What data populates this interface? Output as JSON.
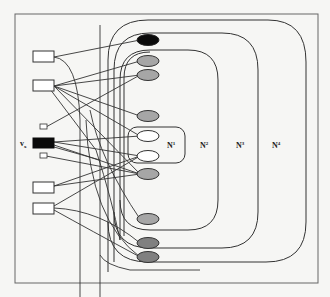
{
  "figure": {
    "labels": {
      "v": "v",
      "v_sub": "x",
      "n1": "N",
      "n1_sup": "1",
      "n2": "N",
      "n2_sup": "2",
      "n3": "N",
      "n3_sup": "3",
      "n4": "N",
      "n4_sup": "4"
    },
    "colors": {
      "background": "#f6f6f4",
      "stroke": "#333333",
      "black_node": "#0a0a0a",
      "gray_node": "#a6a6a6",
      "dark_gray_node": "#808080",
      "white_node": "#ffffff"
    },
    "left_nodes": [
      {
        "id": "box-1",
        "type": "rect"
      },
      {
        "id": "box-2",
        "type": "rect"
      },
      {
        "id": "small-box-1",
        "type": "small-rect"
      },
      {
        "id": "vx-box",
        "type": "black-rect"
      },
      {
        "id": "small-box-2",
        "type": "small-rect"
      },
      {
        "id": "box-3",
        "type": "rect"
      },
      {
        "id": "box-4",
        "type": "rect"
      }
    ],
    "right_nodes": [
      {
        "id": "ellipse-1",
        "fill": "black"
      },
      {
        "id": "ellipse-2",
        "fill": "gray"
      },
      {
        "id": "ellipse-3",
        "fill": "gray"
      },
      {
        "id": "ellipse-4",
        "fill": "gray"
      },
      {
        "id": "ellipse-5",
        "fill": "white"
      },
      {
        "id": "ellipse-6",
        "fill": "white"
      },
      {
        "id": "ellipse-7",
        "fill": "gray"
      },
      {
        "id": "ellipse-8",
        "fill": "gray"
      },
      {
        "id": "ellipse-9",
        "fill": "dark-gray"
      },
      {
        "id": "ellipse-10",
        "fill": "dark-gray"
      }
    ],
    "regions": [
      "N1",
      "N2",
      "N3",
      "N4"
    ]
  }
}
